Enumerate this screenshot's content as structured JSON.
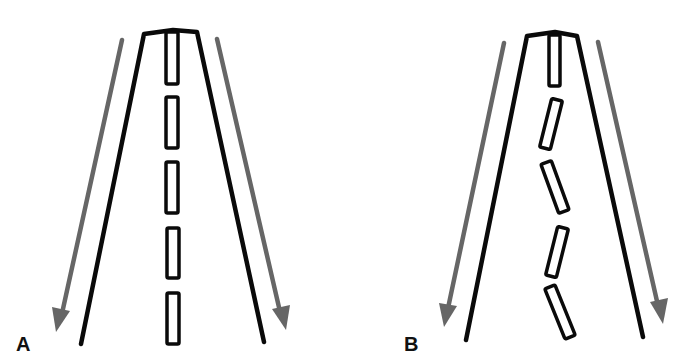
{
  "figure": {
    "colors": {
      "road_edge": "#0a0a0a",
      "dash_outline": "#0a0a0a",
      "arrow": "#666666",
      "background": "#ffffff"
    },
    "panels": [
      {
        "id": "A",
        "label": "A",
        "center_dashes": "straight",
        "dash_count": 5
      },
      {
        "id": "B",
        "label": "B",
        "center_dashes": "zigzag",
        "dash_count": 5
      }
    ]
  }
}
